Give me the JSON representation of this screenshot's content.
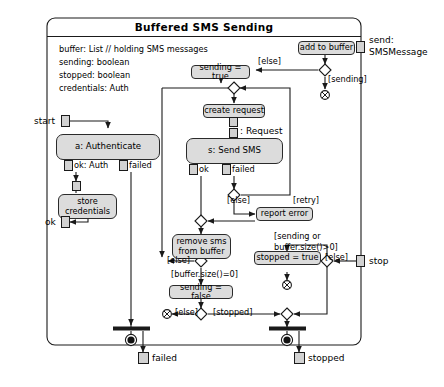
{
  "diagram": {
    "type": "uml-activity-diagram",
    "frame_title": "Buffered SMS Sending",
    "attributes": [
      {
        "name": "buffer: List",
        "comment": "// holding SMS messages"
      },
      {
        "name": "sending: boolean",
        "comment": ""
      },
      {
        "name": "stopped: boolean",
        "comment": ""
      },
      {
        "name": "credentials: Auth",
        "comment": ""
      }
    ],
    "parameter_pins": [
      {
        "id": "pin-start",
        "label": "start",
        "side": "left"
      },
      {
        "id": "pin-ok",
        "label": "ok",
        "side": "left"
      },
      {
        "id": "pin-send",
        "label": "send:\nSMSMessage",
        "label_line1": "send:",
        "label_line2": "SMSMessage",
        "side": "right"
      },
      {
        "id": "pin-stop",
        "label": "stop",
        "side": "right"
      },
      {
        "id": "pin-failed",
        "label": "failed",
        "side": "bottom"
      },
      {
        "id": "pin-stopped",
        "label": "stopped",
        "side": "bottom"
      }
    ],
    "actions": [
      {
        "id": "add-to-buffer",
        "label": "add to buffer"
      },
      {
        "id": "sending-true",
        "label": "sending = true"
      },
      {
        "id": "create-request",
        "label": "create request"
      },
      {
        "id": "send-sms",
        "label": "s: Send SMS"
      },
      {
        "id": "authenticate",
        "label": "a: Authenticate"
      },
      {
        "id": "store-credentials",
        "label": "store\ncredentials"
      },
      {
        "id": "report-error",
        "label": "report error"
      },
      {
        "id": "remove-sms",
        "label": "remove sms\nfrom buffer"
      },
      {
        "id": "sending-false",
        "label": "sending = false"
      },
      {
        "id": "stopped-true",
        "label": "stopped = true"
      }
    ],
    "object_flow_labels": [
      {
        "id": "label-ok-auth",
        "text": "ok: Auth"
      },
      {
        "id": "label-failed-auth",
        "text": "failed"
      },
      {
        "id": "label-request",
        "text": ": Request"
      },
      {
        "id": "label-ok-send",
        "text": "ok"
      },
      {
        "id": "label-failed-send",
        "text": "failed"
      }
    ],
    "guards": [
      {
        "id": "guard-else-buffer",
        "text": "[else]"
      },
      {
        "id": "guard-sending",
        "text": "[sending]"
      },
      {
        "id": "guard-retry",
        "text": "[retry]"
      },
      {
        "id": "guard-else-error",
        "text": "[else]"
      },
      {
        "id": "guard-else-loop",
        "text": "[else]"
      },
      {
        "id": "guard-buffer-empty",
        "text": "[buffer.size()=0]"
      },
      {
        "id": "guard-sending-or-buffer",
        "line1": "[sending or",
        "line2": "buffer.size()>0]"
      },
      {
        "id": "guard-else-stop",
        "text": "[else]"
      },
      {
        "id": "guard-else-final",
        "text": "[else]"
      },
      {
        "id": "guard-stopped",
        "text": "[stopped]"
      }
    ],
    "nodes": {
      "decisions": 7,
      "merges": 2,
      "flow_finals": 3,
      "activity_finals": 2,
      "forks": 2
    },
    "colors": {
      "action_fill": "#dcdcdc",
      "pin_fill": "#d2d2d2",
      "stroke": "#1a1a1a",
      "comment_text": "#8d8d8d",
      "background": "#ffffff"
    }
  }
}
